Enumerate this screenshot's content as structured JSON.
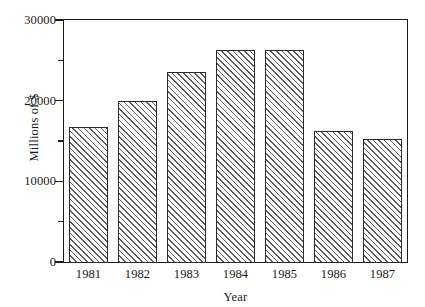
{
  "chart_data": {
    "type": "bar",
    "title": "",
    "subtitle": "",
    "xlabel": "Year",
    "ylabel": "Millions of $",
    "categories": [
      "1981",
      "1982",
      "1983",
      "1984",
      "1985",
      "1986",
      "1987"
    ],
    "values": [
      16900,
      20100,
      23700,
      26400,
      26400,
      16400,
      15400
    ],
    "series": [
      {
        "name": "",
        "values": [
          16900,
          20100,
          23700,
          26400,
          26400,
          16400,
          15400
        ]
      }
    ],
    "ylim": [
      0,
      30000
    ],
    "ytick_values": [
      0,
      5000,
      10000,
      15000,
      20000,
      25000,
      30000
    ],
    "ytick_labels_major": [
      "0",
      "10000",
      "20000",
      "30000"
    ],
    "ytick_major_values": [
      0,
      10000,
      20000,
      30000
    ],
    "grid": false,
    "legend": "none",
    "bar_style": {
      "fill": "diagonal-hatch",
      "hatch_color": "#5d5d5d",
      "background_color": "#ffffff",
      "border_color": "#2b2b2b"
    },
    "axis_color": "#1a1a1a",
    "frame": "box"
  }
}
